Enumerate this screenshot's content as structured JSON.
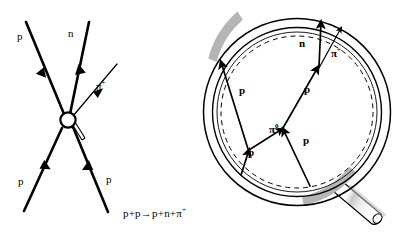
{
  "figure": {
    "width": 402,
    "height": 235,
    "background": "#ffffff",
    "ink": "#000000",
    "shade": "#b0b0b0"
  },
  "feynman": {
    "title": "proton-proton scattering vertex",
    "vertex_blob": "interaction-blob",
    "labels": {
      "out_proton": "p",
      "out_neutron": "n",
      "out_pion": "π",
      "out_pion_charge": "+",
      "in_proton_left": "p",
      "in_proton_right": "p"
    },
    "equation": {
      "lhs_a": "p",
      "plus1": "+",
      "lhs_b": "p",
      "arrow": "→",
      "rhs_a": "p",
      "plus2": "+",
      "rhs_b": "n",
      "plus3": "+",
      "rhs_c": "π",
      "rhs_c_charge": "+",
      "full": "p+p→p+n+π⁺"
    }
  },
  "bubble_chamber": {
    "title": "magnifying glass over bubble chamber tracks",
    "rim_label": "lens-rim",
    "handle_label": "lens-handle",
    "dashed_label": "inner-dashed-circle",
    "tracks": [
      {
        "name": "incoming-proton-upper-left",
        "label": "p"
      },
      {
        "name": "incoming-proton-lower-left",
        "label": "p"
      },
      {
        "name": "neutral-pion",
        "label": "π",
        "charge": "0"
      },
      {
        "name": "scattered-proton-middle",
        "label": "p"
      },
      {
        "name": "scattered-proton-lower-right",
        "label": "p"
      },
      {
        "name": "outgoing-neutron",
        "label": "n"
      },
      {
        "name": "outgoing-pion",
        "label": "π",
        "charge": "+"
      }
    ],
    "labels": {
      "p_upper_left": "p",
      "p_lower_left": "p",
      "pi_zero": "π",
      "pi_zero_charge": "0",
      "p_middle": "p",
      "p_lower_right": "p",
      "n_top": "n",
      "pi_plus": "π",
      "pi_plus_charge": "+"
    }
  }
}
